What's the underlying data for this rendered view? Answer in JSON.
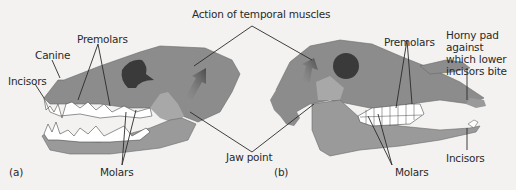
{
  "figure": {
    "title_label": "Action of temporal muscles",
    "jaw_point_label": "Jaw point",
    "colors": {
      "skull": "#8c8c8c",
      "skull_light": "#a8a8a8",
      "orbit": "#3a3a3a",
      "teeth": "#ffffff",
      "line": "#2a2a2a",
      "arrow": "#5a5a5a",
      "background": "#f3f2f0"
    }
  },
  "panel_a": {
    "tag": "(a)",
    "labels": {
      "incisors": "Incisors",
      "canine": "Canine",
      "premolars": "Premolars",
      "molars": "Molars"
    }
  },
  "panel_b": {
    "tag": "(b)",
    "labels": {
      "premolars": "Premolars",
      "horny_pad": "Horny pad against which lower incisors bite",
      "incisors": "Incisors",
      "molars": "Molars"
    }
  }
}
